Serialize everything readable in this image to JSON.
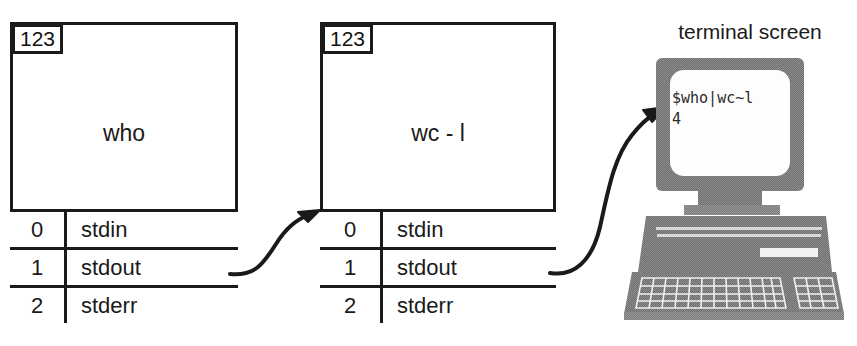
{
  "diagram": {
    "title_label": "terminal screen",
    "processes": [
      {
        "pid": "123",
        "name": "who",
        "fds": [
          {
            "num": "0",
            "label": "stdin"
          },
          {
            "num": "1",
            "label": "stdout"
          },
          {
            "num": "2",
            "label": "stderr"
          }
        ]
      },
      {
        "pid": "123",
        "name": "wc - l",
        "fds": [
          {
            "num": "0",
            "label": "stdin"
          },
          {
            "num": "1",
            "label": "stdout"
          },
          {
            "num": "2",
            "label": "stderr"
          }
        ]
      }
    ],
    "terminal": {
      "line1": "$who|wc~l",
      "line2": "4"
    },
    "colors": {
      "stroke": "#1a1a1a",
      "background": "#ffffff",
      "computer_body": "#6b6b6b",
      "computer_body_light": "#8a8a8a",
      "screen": "#fdfdfd",
      "text": "#2a2a2a"
    },
    "icons": {
      "arrow1": "curved-arrow-icon",
      "arrow2": "curved-arrow-icon",
      "computer": "desktop-computer-icon"
    }
  }
}
